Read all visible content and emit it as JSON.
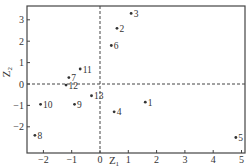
{
  "chart_data": {
    "type": "scatter",
    "title": "",
    "xlabel": "Z1",
    "ylabel": "Z2",
    "xlim": [
      -2.6,
      5.0
    ],
    "ylim": [
      -2.7,
      3.6
    ],
    "xticks": [
      -2,
      -1,
      0,
      1,
      2,
      3,
      4,
      5
    ],
    "yticks": [
      -2,
      -1,
      0,
      1,
      2,
      3
    ],
    "reference_lines": {
      "x": 0,
      "y": 0,
      "style": "dashed"
    },
    "grid": false,
    "points": [
      {
        "label": "1",
        "x": 1.6,
        "y": -0.85
      },
      {
        "label": "2",
        "x": 0.6,
        "y": 2.6
      },
      {
        "label": "3",
        "x": 1.1,
        "y": 3.3
      },
      {
        "label": "4",
        "x": 0.5,
        "y": -1.3
      },
      {
        "label": "5",
        "x": 4.8,
        "y": -2.5
      },
      {
        "label": "6",
        "x": 0.4,
        "y": 1.8
      },
      {
        "label": "7",
        "x": -1.1,
        "y": 0.3
      },
      {
        "label": "8",
        "x": -2.3,
        "y": -2.4
      },
      {
        "label": "9",
        "x": -0.9,
        "y": -0.95
      },
      {
        "label": "10",
        "x": -2.1,
        "y": -0.95
      },
      {
        "label": "11",
        "x": -0.7,
        "y": 0.7
      },
      {
        "label": "12",
        "x": -1.2,
        "y": -0.05
      },
      {
        "label": "13",
        "x": -0.3,
        "y": -0.55
      }
    ]
  }
}
